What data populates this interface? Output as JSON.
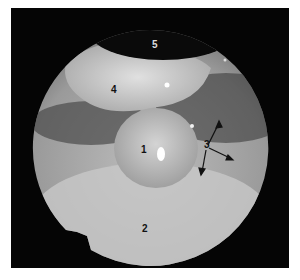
{
  "image": {
    "type": "endoscopic view",
    "labels": [
      {
        "id": "1",
        "text": "1",
        "x": 141,
        "y": 145
      },
      {
        "id": "2",
        "text": "2",
        "x": 142,
        "y": 224
      },
      {
        "id": "3",
        "text": "3",
        "x": 204,
        "y": 140
      },
      {
        "id": "4",
        "text": "4",
        "x": 111,
        "y": 85
      },
      {
        "id": "5",
        "text": "5",
        "x": 152,
        "y": 40
      }
    ],
    "arrows_from_label": "3",
    "arrow_count": 3
  }
}
